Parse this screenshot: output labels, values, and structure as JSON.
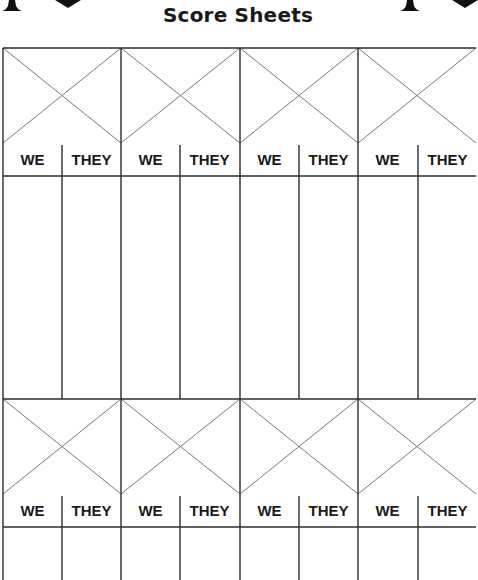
{
  "header": {
    "title": "Score Sheets",
    "decorations": {
      "left": [
        "spade-icon",
        "heart-icon"
      ],
      "right": [
        "spade-icon",
        "heart-icon"
      ]
    }
  },
  "score_sheet": {
    "sections": [
      {
        "name": "section-1",
        "games": [
          {
            "columns": [
              "WE",
              "THEY"
            ]
          },
          {
            "columns": [
              "WE",
              "THEY"
            ]
          },
          {
            "columns": [
              "WE",
              "THEY"
            ]
          },
          {
            "columns": [
              "WE",
              "THEY"
            ]
          }
        ]
      },
      {
        "name": "section-2",
        "games": [
          {
            "columns": [
              "WE",
              "THEY"
            ]
          },
          {
            "columns": [
              "WE",
              "THEY"
            ]
          },
          {
            "columns": [
              "WE",
              "THEY"
            ]
          },
          {
            "columns": [
              "WE",
              "THEY"
            ]
          }
        ]
      }
    ]
  },
  "colors": {
    "grid_line": "#2b2b2b",
    "diagonal_line": "#7a7a7a",
    "text": "#1a1a1a",
    "background": "#ffffff"
  }
}
